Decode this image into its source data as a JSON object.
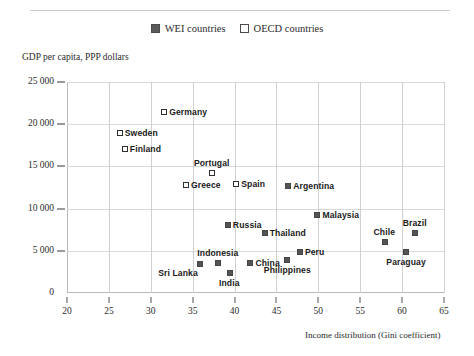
{
  "legend": {
    "position": "top-center",
    "entries": [
      {
        "label": "WEI countries",
        "marker": "filled-square",
        "color": "#545454"
      },
      {
        "label": "OECD countries",
        "marker": "open-square",
        "color": "#ffffff"
      }
    ]
  },
  "chart_data": {
    "type": "scatter",
    "title": "",
    "xlabel": "Income distribution (Gini coefficient)",
    "ylabel": "GDP per capita, PPP dollars",
    "xlim": [
      20,
      65
    ],
    "ylim": [
      0,
      25000
    ],
    "xticks": [
      "20",
      "25",
      "30",
      "35",
      "40",
      "45",
      "50",
      "55",
      "60",
      "65"
    ],
    "yticks": [
      "0",
      "5 000",
      "10 000",
      "15 000",
      "20 000",
      "25 000"
    ],
    "grid": "both",
    "series": [
      {
        "name": "OECD countries",
        "marker": "open-square",
        "points": [
          {
            "label": "Germany",
            "x": 31.6,
            "y": 21500,
            "label_pos": "right"
          },
          {
            "label": "Sweden",
            "x": 26.3,
            "y": 19000,
            "label_pos": "right"
          },
          {
            "label": "Finland",
            "x": 26.9,
            "y": 17100,
            "label_pos": "right"
          },
          {
            "label": "Portugal",
            "x": 37.3,
            "y": 14200,
            "label_pos": "above"
          },
          {
            "label": "Greece",
            "x": 34.2,
            "y": 12800,
            "label_pos": "right"
          },
          {
            "label": "Spain",
            "x": 40.2,
            "y": 12900,
            "label_pos": "right"
          }
        ]
      },
      {
        "name": "WEI countries",
        "marker": "filled-square",
        "points": [
          {
            "label": "Argentina",
            "x": 46.4,
            "y": 12700,
            "label_pos": "right"
          },
          {
            "label": "Malaysia",
            "x": 49.9,
            "y": 9300,
            "label_pos": "right"
          },
          {
            "label": "Russia",
            "x": 39.2,
            "y": 8000,
            "label_pos": "right"
          },
          {
            "label": "Thailand",
            "x": 43.6,
            "y": 7100,
            "label_pos": "right"
          },
          {
            "label": "Brazil",
            "x": 61.5,
            "y": 7100,
            "label_pos": "above"
          },
          {
            "label": "Chile",
            "x": 57.9,
            "y": 6000,
            "label_pos": "above"
          },
          {
            "label": "Peru",
            "x": 47.8,
            "y": 4800,
            "label_pos": "right"
          },
          {
            "label": "Paraguay",
            "x": 60.5,
            "y": 4800,
            "label_pos": "below"
          },
          {
            "label": "China",
            "x": 41.9,
            "y": 3600,
            "label_pos": "right"
          },
          {
            "label": "Philippines",
            "x": 46.3,
            "y": 3900,
            "label_pos": "below"
          },
          {
            "label": "Indonesia",
            "x": 38.0,
            "y": 3500,
            "label_pos": "above"
          },
          {
            "label": "Sri Lanka",
            "x": 35.9,
            "y": 3400,
            "label_pos": "below-left"
          },
          {
            "label": "India",
            "x": 39.4,
            "y": 2400,
            "label_pos": "below"
          }
        ]
      }
    ]
  }
}
